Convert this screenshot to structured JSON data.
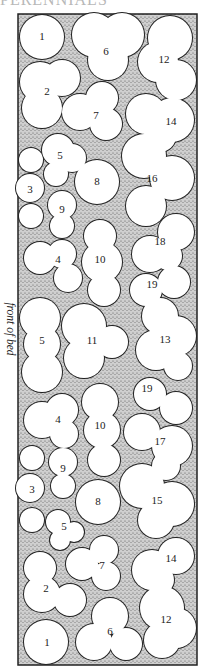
{
  "header": {
    "text": "PERENNIALS"
  },
  "side_label": "front of bed",
  "colors": {
    "stipple_bg": "#c9c9c9",
    "stipple_dot": "#555555",
    "outline": "#222222",
    "plant_fill": "#ffffff"
  },
  "bed": {
    "x": 18,
    "y": 14,
    "width": 179,
    "height": 651
  },
  "plants": [
    {
      "id": "1",
      "label": "1",
      "lx": 42,
      "ly": 37,
      "circles": [
        [
          42,
          37,
          22
        ]
      ]
    },
    {
      "id": "6",
      "label": "6",
      "lx": 106,
      "ly": 52,
      "circles": [
        [
          94,
          35,
          22
        ],
        [
          122,
          35,
          22
        ],
        [
          108,
          60,
          20
        ]
      ]
    },
    {
      "id": "12",
      "label": "12",
      "lx": 164,
      "ly": 60,
      "circles": [
        [
          170,
          38,
          22
        ],
        [
          158,
          62,
          20
        ],
        [
          176,
          80,
          20
        ]
      ]
    },
    {
      "id": "2",
      "label": "2",
      "lx": 47,
      "ly": 92,
      "circles": [
        [
          40,
          82,
          20
        ],
        [
          62,
          78,
          18
        ],
        [
          42,
          108,
          20
        ]
      ]
    },
    {
      "id": "7",
      "label": "7",
      "lx": 96,
      "ly": 116,
      "circles": [
        [
          80,
          112,
          18
        ],
        [
          102,
          98,
          16
        ],
        [
          106,
          124,
          16
        ]
      ]
    },
    {
      "id": "14",
      "label": "14",
      "lx": 171,
      "ly": 122,
      "circles": [
        [
          146,
          114,
          20
        ],
        [
          172,
          120,
          22
        ],
        [
          160,
          136,
          16
        ]
      ]
    },
    {
      "id": "5a",
      "label": "5",
      "lx": 60,
      "ly": 156,
      "circles": [
        [
          58,
          150,
          16
        ],
        [
          72,
          158,
          14
        ],
        [
          56,
          174,
          12
        ]
      ]
    },
    {
      "id": "3a",
      "label": "3",
      "lx": 30,
      "ly": 190,
      "circles": [
        [
          31,
          160,
          12
        ],
        [
          30,
          188,
          14
        ],
        [
          31,
          216,
          12
        ]
      ]
    },
    {
      "id": "8a",
      "label": "8",
      "lx": 97,
      "ly": 182,
      "circles": [
        [
          97,
          182,
          22
        ]
      ]
    },
    {
      "id": "16",
      "label": "16",
      "lx": 152,
      "ly": 179,
      "circles": [
        [
          144,
          156,
          22
        ],
        [
          172,
          178,
          22
        ],
        [
          146,
          206,
          20
        ]
      ]
    },
    {
      "id": "9a",
      "label": "9",
      "lx": 62,
      "ly": 210,
      "circles": [
        [
          62,
          205,
          14
        ],
        [
          62,
          226,
          12
        ]
      ]
    },
    {
      "id": "4a",
      "label": "4",
      "lx": 58,
      "ly": 260,
      "circles": [
        [
          40,
          258,
          16
        ],
        [
          62,
          254,
          14
        ],
        [
          68,
          278,
          14
        ]
      ]
    },
    {
      "id": "10a",
      "label": "10",
      "lx": 100,
      "ly": 260,
      "circles": [
        [
          100,
          236,
          16
        ],
        [
          102,
          262,
          20
        ],
        [
          104,
          290,
          16
        ]
      ]
    },
    {
      "id": "18",
      "label": "18",
      "lx": 160,
      "ly": 242,
      "circles": [
        [
          176,
          232,
          18
        ],
        [
          150,
          254,
          18
        ],
        [
          168,
          256,
          14
        ]
      ]
    },
    {
      "id": "19a",
      "label": "19",
      "lx": 152,
      "ly": 285,
      "circles": [
        [
          146,
          290,
          16
        ],
        [
          174,
          282,
          16
        ]
      ]
    },
    {
      "id": "5b",
      "label": "5",
      "lx": 42,
      "ly": 341,
      "circles": [
        [
          40,
          318,
          20
        ],
        [
          42,
          344,
          18
        ],
        [
          42,
          372,
          20
        ]
      ]
    },
    {
      "id": "11",
      "label": "11",
      "lx": 92,
      "ly": 341,
      "circles": [
        [
          84,
          326,
          22
        ],
        [
          112,
          342,
          16
        ],
        [
          84,
          358,
          20
        ]
      ]
    },
    {
      "id": "13",
      "label": "13",
      "lx": 165,
      "ly": 340,
      "circles": [
        [
          160,
          316,
          18
        ],
        [
          176,
          336,
          20
        ],
        [
          156,
          350,
          20
        ],
        [
          178,
          366,
          14
        ]
      ]
    },
    {
      "id": "19b",
      "label": "19",
      "lx": 147,
      "ly": 389,
      "circles": [
        [
          150,
          394,
          16
        ],
        [
          176,
          408,
          16
        ]
      ]
    },
    {
      "id": "4b",
      "label": "4",
      "lx": 58,
      "ly": 420,
      "circles": [
        [
          42,
          420,
          18
        ],
        [
          62,
          410,
          16
        ],
        [
          64,
          434,
          14
        ]
      ]
    },
    {
      "id": "10b",
      "label": "10",
      "lx": 100,
      "ly": 426,
      "circles": [
        [
          100,
          402,
          18
        ],
        [
          102,
          430,
          18
        ],
        [
          104,
          460,
          16
        ]
      ]
    },
    {
      "id": "17",
      "label": "17",
      "lx": 160,
      "ly": 442,
      "circles": [
        [
          142,
          432,
          18
        ],
        [
          172,
          446,
          20
        ],
        [
          166,
          466,
          14
        ]
      ]
    },
    {
      "id": "3b",
      "label": "3",
      "lx": 32,
      "ly": 490,
      "circles": [
        [
          32,
          458,
          12
        ],
        [
          30,
          488,
          14
        ],
        [
          32,
          520,
          12
        ]
      ]
    },
    {
      "id": "9b",
      "label": "9",
      "lx": 63,
      "ly": 469,
      "circles": [
        [
          63,
          462,
          14
        ],
        [
          63,
          486,
          12
        ]
      ]
    },
    {
      "id": "8b",
      "label": "8",
      "lx": 98,
      "ly": 502,
      "circles": [
        [
          98,
          502,
          22
        ]
      ]
    },
    {
      "id": "15",
      "label": "15",
      "lx": 157,
      "ly": 501,
      "circles": [
        [
          142,
          486,
          22
        ],
        [
          172,
          504,
          22
        ],
        [
          156,
          520,
          18
        ]
      ]
    },
    {
      "id": "5c",
      "label": "5",
      "lx": 64,
      "ly": 527,
      "circles": [
        [
          58,
          522,
          12
        ],
        [
          74,
          532,
          10
        ],
        [
          60,
          540,
          10
        ]
      ]
    },
    {
      "id": "7b",
      "label": "7",
      "lx": 102,
      "ly": 566,
      "circles": [
        [
          82,
          564,
          16
        ],
        [
          104,
          550,
          14
        ],
        [
          106,
          576,
          14
        ]
      ]
    },
    {
      "id": "14b",
      "label": "14",
      "lx": 171,
      "ly": 559,
      "circles": [
        [
          152,
          570,
          20
        ],
        [
          176,
          556,
          18
        ],
        [
          160,
          580,
          14
        ]
      ]
    },
    {
      "id": "2b",
      "label": "2",
      "lx": 46,
      "ly": 589,
      "circles": [
        [
          40,
          568,
          16
        ],
        [
          42,
          594,
          18
        ],
        [
          70,
          600,
          16
        ]
      ]
    },
    {
      "id": "12b",
      "label": "12",
      "lx": 166,
      "ly": 620,
      "circles": [
        [
          162,
          608,
          22
        ],
        [
          176,
          628,
          20
        ],
        [
          162,
          640,
          18
        ]
      ]
    },
    {
      "id": "6b",
      "label": "6",
      "lx": 110,
      "ly": 632,
      "circles": [
        [
          110,
          616,
          18
        ],
        [
          94,
          642,
          18
        ],
        [
          126,
          644,
          16
        ]
      ]
    },
    {
      "id": "1b",
      "label": "1",
      "lx": 47,
      "ly": 643,
      "circles": [
        [
          46,
          642,
          22
        ]
      ]
    }
  ]
}
